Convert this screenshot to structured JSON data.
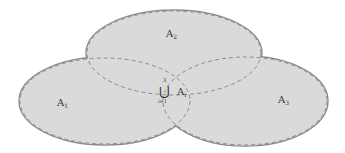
{
  "diagram": {
    "type": "venn",
    "colors": {
      "fill": "#dadada",
      "outline": "#8a8a8a",
      "dashed": "#8a8a8a",
      "text": "#333333"
    },
    "sets": [
      {
        "id": "A1",
        "label": "A",
        "subscript": "1",
        "cx": 105,
        "cy": 101,
        "rx": 86,
        "ry": 44
      },
      {
        "id": "A2",
        "label": "A",
        "subscript": "2",
        "cx": 174,
        "cy": 53,
        "rx": 88,
        "ry": 43
      },
      {
        "id": "A3",
        "label": "A",
        "subscript": "3",
        "cx": 245,
        "cy": 101,
        "rx": 83,
        "ry": 45
      }
    ],
    "union_label": {
      "symbol": "⋃",
      "upper": "3",
      "lower": "i=1",
      "operand": "A",
      "operand_subscript": "i"
    }
  }
}
